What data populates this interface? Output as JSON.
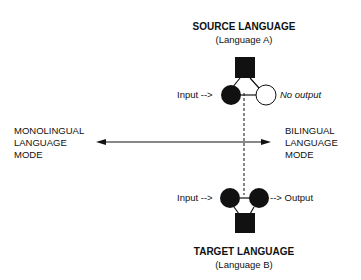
{
  "source": {
    "title": "SOURCE LANGUAGE",
    "subtitle": "(Language A)",
    "input_label": "Input -->",
    "output_label": "No output"
  },
  "target": {
    "title": "TARGET LANGUAGE",
    "subtitle": "(Language B)",
    "input_label": "Input -->",
    "output_label": "--> Output"
  },
  "axis": {
    "left_label": [
      "MONOLINGUAL",
      "LANGUAGE",
      "MODE"
    ],
    "right_label": [
      "BILINGUAL",
      "LANGUAGE",
      "MODE"
    ]
  },
  "colors": {
    "ink": "#111111",
    "background": "#ffffff"
  }
}
